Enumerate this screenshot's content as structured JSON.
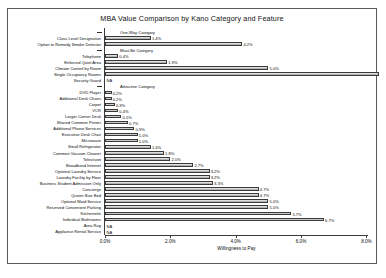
{
  "chart_data": {
    "type": "bar",
    "orientation": "horizontal",
    "title": "MBA Value Comparison by Kano Category and Feature",
    "xlabel": "Willingness to Pay",
    "ylabel": "",
    "xlim": [
      0,
      8.6
    ],
    "xticks": [
      "0.0%",
      "2.0%",
      "4.0%",
      "6.0%",
      "8.0%"
    ],
    "xtick_values": [
      0,
      2,
      4,
      6,
      8
    ],
    "grid": false,
    "legend": null,
    "groups": [
      {
        "name": "One-Way Category",
        "items": [
          {
            "label": "Class Level Designation",
            "value": 1.4,
            "value_label": "1.4%"
          },
          {
            "label": "Option to Remedy Smoke Detector",
            "value": 4.2,
            "value_label": "4.2%"
          }
        ]
      },
      {
        "name": "Must-Be Category",
        "items": [
          {
            "label": "Telephone",
            "value": 0.4,
            "value_label": "0.4%"
          },
          {
            "label": "Enforced Quiet Area",
            "value": 1.9,
            "value_label": "1.9%"
          },
          {
            "label": "Climate Control by Room",
            "value": 5.0,
            "value_label": "5.0%"
          },
          {
            "label": "Single Occupancy Rooms",
            "value": 8.4,
            "value_label": ""
          },
          {
            "label": "Security Guard",
            "value": null,
            "value_label": "NA"
          }
        ]
      },
      {
        "name": "Attractive Category",
        "items": [
          {
            "label": "DVD Player",
            "value": 0.2,
            "value_label": "0.2%"
          },
          {
            "label": "Additional Desk Chairs",
            "value": 0.2,
            "value_label": "0.2%"
          },
          {
            "label": "Carpet",
            "value": 0.3,
            "value_label": "0.3%"
          },
          {
            "label": "VCR",
            "value": 0.4,
            "value_label": "0.4%"
          },
          {
            "label": "Larger Corner Desk",
            "value": 0.5,
            "value_label": "0.5%"
          },
          {
            "label": "Shared Common Printer",
            "value": 0.7,
            "value_label": "0.7%"
          },
          {
            "label": "Additional Phone Services",
            "value": 0.9,
            "value_label": "0.9%"
          },
          {
            "label": "Executive Desk Chair",
            "value": 1.0,
            "value_label": "1.0%"
          },
          {
            "label": "Microwave",
            "value": 1.0,
            "value_label": "1.0%"
          },
          {
            "label": "Small Refrigerator",
            "value": 1.4,
            "value_label": "1.4%"
          },
          {
            "label": "Common Vacuum Cleaner",
            "value": 1.8,
            "value_label": "1.8%"
          },
          {
            "label": "Television",
            "value": 2.0,
            "value_label": "2.0%"
          },
          {
            "label": "Broadband Internet",
            "value": 2.7,
            "value_label": "2.7%"
          },
          {
            "label": "Optional Laundry Service",
            "value": 3.2,
            "value_label": "3.2%"
          },
          {
            "label": "Laundry Facility by Floor",
            "value": 3.2,
            "value_label": "3.2%"
          },
          {
            "label": "Business Student Admission Only",
            "value": 3.3,
            "value_label": "3.3%"
          },
          {
            "label": "Concierge",
            "value": 4.7,
            "value_label": "4.7%"
          },
          {
            "label": "Queen Size Bed",
            "value": 4.7,
            "value_label": "4.7%"
          },
          {
            "label": "Optional Maid Service",
            "value": 5.0,
            "value_label": "5.0%"
          },
          {
            "label": "Reserved Convenient Parking",
            "value": 5.0,
            "value_label": "5.0%"
          },
          {
            "label": "Kitchenette",
            "value": 5.7,
            "value_label": "5.7%"
          },
          {
            "label": "Individual Bathrooms",
            "value": 6.7,
            "value_label": "6.7%"
          },
          {
            "label": "Area Rug",
            "value": null,
            "value_label": "NA"
          },
          {
            "label": "Appliance Rental Service",
            "value": null,
            "value_label": "NA"
          }
        ]
      }
    ]
  }
}
